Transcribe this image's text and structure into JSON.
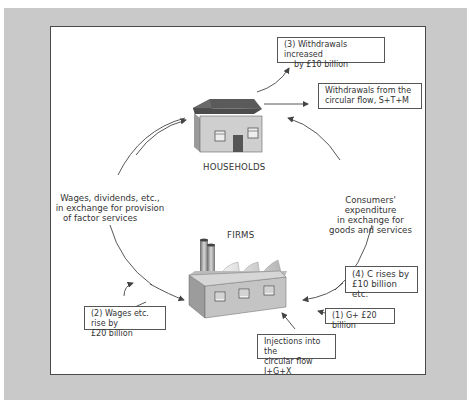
{
  "diagram": {
    "nodes": {
      "households": {
        "label": "HOUSEHOLDS"
      },
      "firms": {
        "label": "FIRMS"
      }
    },
    "flow_labels": {
      "left": [
        "Wages, dividends, etc.,",
        "in exchange for provision",
        "of factor services"
      ],
      "right": [
        "Consumers' expenditure",
        "in exchange for",
        "goods and services"
      ]
    },
    "boxes": {
      "withdrawals_increased": [
        "(3) Withdrawals increased",
        "by £10 billion"
      ],
      "withdrawals_flow": [
        "Withdrawals from the",
        "circular flow, S+T+M"
      ],
      "c_rises": [
        "(4) C rises by",
        "£10 billion etc."
      ],
      "g_plus": [
        "(1) G+ £20 billion"
      ],
      "wages_rise": [
        "(2) Wages etc. rise by",
        "£20 billion"
      ],
      "injections": [
        "Injections into the",
        "circular flow I+G+X"
      ]
    },
    "colors": {
      "panel": "#c9c9c9",
      "roof": "#5a5a5a",
      "wall": "#c8c8c8",
      "line": "#444444"
    }
  }
}
